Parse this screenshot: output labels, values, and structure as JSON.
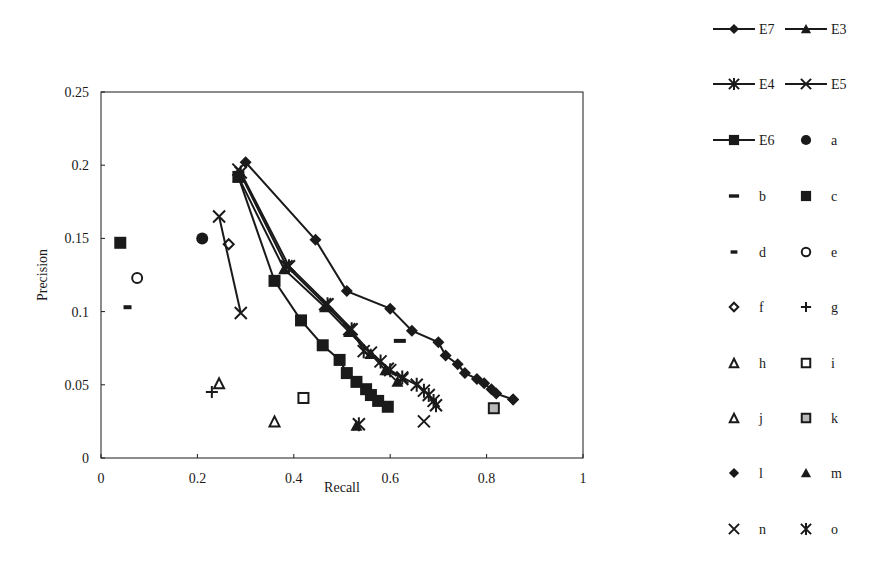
{
  "chart_data": {
    "type": "scatter",
    "title": "",
    "xlabel": "Recall",
    "ylabel": "Precision",
    "xlim": [
      0,
      1
    ],
    "ylim": [
      0,
      0.25
    ],
    "xticks": [
      "0",
      "0.2",
      "0.4",
      "0.6",
      "0.8",
      "1"
    ],
    "xtick_values": [
      0,
      0.2,
      0.4,
      0.6,
      0.8,
      1
    ],
    "yticks": [
      "0",
      "0.05",
      "0.1",
      "0.15",
      "0.2",
      "0.25"
    ],
    "ytick_values": [
      0,
      0.05,
      0.1,
      0.15,
      0.2,
      0.25
    ],
    "grid": false,
    "legend_position": "right",
    "series": [
      {
        "name": "E7",
        "marker": "diamond-filled",
        "line": true,
        "x": [
          0.3,
          0.445,
          0.51,
          0.6,
          0.645,
          0.7,
          0.715,
          0.74,
          0.755,
          0.78,
          0.795,
          0.81,
          0.82,
          0.855
        ],
        "y": [
          0.202,
          0.149,
          0.114,
          0.102,
          0.087,
          0.079,
          0.07,
          0.064,
          0.058,
          0.054,
          0.051,
          0.047,
          0.044,
          0.04
        ]
      },
      {
        "name": "E3",
        "marker": "triangle-filled",
        "line": true,
        "x": [
          0.285,
          0.38,
          0.465,
          0.515,
          0.56,
          0.59,
          0.615
        ],
        "y": [
          0.192,
          0.129,
          0.103,
          0.086,
          0.071,
          0.06,
          0.052
        ]
      },
      {
        "name": "E4",
        "marker": "asterisk",
        "line": true,
        "x": [
          0.29,
          0.39,
          0.47,
          0.52,
          0.545,
          0.58,
          0.6,
          0.625,
          0.655,
          0.67,
          0.68,
          0.69,
          0.695
        ],
        "y": [
          0.195,
          0.131,
          0.105,
          0.088,
          0.073,
          0.066,
          0.06,
          0.055,
          0.05,
          0.046,
          0.043,
          0.039,
          0.036
        ]
      },
      {
        "name": "E5",
        "marker": "x",
        "line": true,
        "x": [
          0.285,
          0.385,
          0.465,
          0.515,
          0.56,
          0.595,
          0.625
        ],
        "y": [
          0.197,
          0.131,
          0.105,
          0.088,
          0.072,
          0.061,
          0.054
        ]
      },
      {
        "name": "E6",
        "marker": "square-filled",
        "line": true,
        "x": [
          0.285,
          0.36,
          0.415,
          0.46,
          0.495,
          0.51,
          0.53,
          0.55,
          0.56,
          0.575,
          0.595
        ],
        "y": [
          0.192,
          0.121,
          0.094,
          0.077,
          0.067,
          0.058,
          0.052,
          0.047,
          0.043,
          0.039,
          0.035
        ]
      },
      {
        "name": "a",
        "marker": "circle-filled",
        "line": false,
        "x": [
          0.21
        ],
        "y": [
          0.15
        ]
      },
      {
        "name": "b",
        "marker": "dash-wide",
        "line": false,
        "x": [
          0.62
        ],
        "y": [
          0.08
        ]
      },
      {
        "name": "c",
        "marker": "square-filled",
        "line": false,
        "x": [
          0.04
        ],
        "y": [
          0.147
        ]
      },
      {
        "name": "d",
        "marker": "dash-short",
        "line": false,
        "x": [
          0.055
        ],
        "y": [
          0.103
        ]
      },
      {
        "name": "e",
        "marker": "circle-open",
        "line": false,
        "x": [
          0.075
        ],
        "y": [
          0.123
        ]
      },
      {
        "name": "f",
        "marker": "diamond-open",
        "line": false,
        "x": [
          0.265
        ],
        "y": [
          0.146
        ]
      },
      {
        "name": "g",
        "marker": "plus",
        "line": false,
        "x": [
          0.23
        ],
        "y": [
          0.045
        ]
      },
      {
        "name": "h",
        "marker": "triangle-open",
        "line": false,
        "x": [
          0.245
        ],
        "y": [
          0.051
        ]
      },
      {
        "name": "i",
        "marker": "square-open",
        "line": false,
        "x": [
          0.42
        ],
        "y": [
          0.041
        ]
      },
      {
        "name": "j",
        "marker": "triangle-open",
        "line": false,
        "x": [
          0.36
        ],
        "y": [
          0.025
        ]
      },
      {
        "name": "k",
        "marker": "square-gray",
        "line": false,
        "x": [
          0.815
        ],
        "y": [
          0.034
        ]
      },
      {
        "name": "l",
        "marker": "diamond-filled",
        "line": false,
        "x": [
          0.855
        ],
        "y": [
          0.04
        ]
      },
      {
        "name": "m",
        "marker": "triangle-filled",
        "line": false,
        "x": [
          0.53
        ],
        "y": [
          0.022
        ]
      },
      {
        "name": "n-cluster",
        "marker": "x",
        "line": true,
        "x": [
          0.245,
          0.29
        ],
        "y": [
          0.165,
          0.099
        ]
      },
      {
        "name": "n",
        "marker": "x",
        "line": false,
        "x": [
          0.67
        ],
        "y": [
          0.025
        ]
      },
      {
        "name": "o",
        "marker": "asterisk",
        "line": false,
        "x": [
          0.535
        ],
        "y": [
          0.023
        ]
      }
    ],
    "legend": [
      [
        "E7",
        "E3"
      ],
      [
        "E4",
        "E5"
      ],
      [
        "E6",
        "a"
      ],
      [
        "b",
        "c"
      ],
      [
        "d",
        "e"
      ],
      [
        "f",
        "g"
      ],
      [
        "h",
        "i"
      ],
      [
        "j",
        "k"
      ],
      [
        "l",
        "m"
      ],
      [
        "n",
        "o"
      ]
    ]
  },
  "legend_items": [
    {
      "label": "E7",
      "marker": "diamond-filled",
      "line": true
    },
    {
      "label": "E3",
      "marker": "triangle-filled",
      "line": true
    },
    {
      "label": "E4",
      "marker": "asterisk",
      "line": true
    },
    {
      "label": "E5",
      "marker": "x",
      "line": true
    },
    {
      "label": "E6",
      "marker": "square-filled",
      "line": true
    },
    {
      "label": "a",
      "marker": "circle-filled",
      "line": false
    },
    {
      "label": "b",
      "marker": "dash-wide",
      "line": false
    },
    {
      "label": "c",
      "marker": "square-filled",
      "line": false
    },
    {
      "label": "d",
      "marker": "dash-short",
      "line": false
    },
    {
      "label": "e",
      "marker": "circle-open",
      "line": false
    },
    {
      "label": "f",
      "marker": "diamond-open",
      "line": false
    },
    {
      "label": "g",
      "marker": "plus",
      "line": false
    },
    {
      "label": "h",
      "marker": "triangle-open",
      "line": false
    },
    {
      "label": "i",
      "marker": "square-open",
      "line": false
    },
    {
      "label": "j",
      "marker": "triangle-open",
      "line": false
    },
    {
      "label": "k",
      "marker": "square-gray",
      "line": false
    },
    {
      "label": "l",
      "marker": "diamond-filled",
      "line": false
    },
    {
      "label": "m",
      "marker": "triangle-filled",
      "line": false
    },
    {
      "label": "n",
      "marker": "x",
      "line": false
    },
    {
      "label": "o",
      "marker": "asterisk",
      "line": false
    }
  ],
  "colors": {
    "ink": "#1a1a1a",
    "gray_fill": "#b8b8b8",
    "background": "#ffffff"
  }
}
